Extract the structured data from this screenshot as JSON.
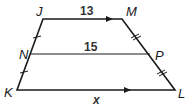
{
  "diagram": {
    "type": "trapezoid-midsegment",
    "vertices": {
      "J": {
        "label": "J",
        "x": 43,
        "y": 19
      },
      "M": {
        "label": "M",
        "x": 122,
        "y": 19
      },
      "N": {
        "label": "N",
        "x": 31,
        "y": 54
      },
      "P": {
        "label": "P",
        "x": 150,
        "y": 54
      },
      "K": {
        "label": "K",
        "x": 17,
        "y": 90
      },
      "L": {
        "label": "L",
        "x": 175,
        "y": 90
      }
    },
    "segments": {
      "JM": {
        "label": "13"
      },
      "NP": {
        "label": "15"
      },
      "KL": {
        "label": "x"
      }
    },
    "markings": {
      "JN_KN": "single tick (congruent)",
      "MP_PL": "double tick (congruent)",
      "JM_KL": "parallel arrows"
    },
    "colors": {
      "stroke": "#1a1a1a",
      "background": "#ffffff"
    }
  }
}
